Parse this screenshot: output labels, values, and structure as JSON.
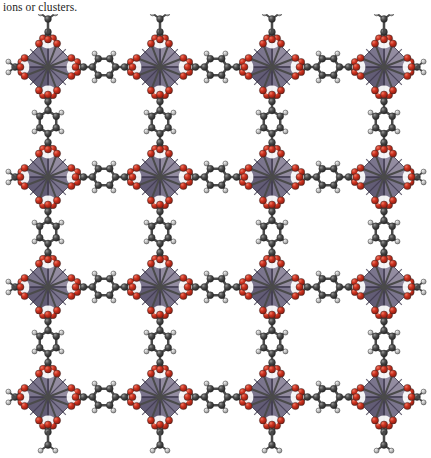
{
  "caption": {
    "text": "ions or clusters."
  },
  "figure": {
    "name": "metal-organic-framework-crystal-structure",
    "background_color": "#ffffff",
    "grid": {
      "rows": 4,
      "columns": 4,
      "node_centers_x": [
        48,
        160,
        272,
        384
      ],
      "node_centers_y": [
        53,
        163,
        273,
        383
      ],
      "horizontal_spacing": 112,
      "vertical_spacing": 110,
      "node_radius": 30
    },
    "colors": {
      "polyhedron_light": "#8b8399",
      "polyhedron_mid": "#716a84",
      "polyhedron_dark": "#56506b",
      "polyhedron_edge": "#3b3649",
      "oxygen": "#c42a1a",
      "oxygen_highlight": "#e8604e",
      "carbon": "#4a4a4a",
      "carbon_highlight": "#8e8e8e",
      "hydrogen": "#b9b9b9",
      "hydrogen_highlight": "#e6e6e6",
      "bond": "#4a4a4a",
      "metal_center": "#6a6275"
    },
    "legend": {
      "node_label": "metal-oxide cluster (octahedron)",
      "linker_label": "benzenedicarboxylate linker",
      "oxygen_label": "oxygen",
      "carbon_label": "carbon",
      "hydrogen_label": "hydrogen"
    },
    "atom_radii": {
      "oxygen": 3.6,
      "carbon": 3.4,
      "hydrogen": 2.5
    }
  }
}
